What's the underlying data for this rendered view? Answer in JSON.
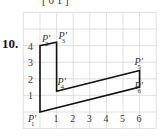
{
  "problem_number": "10.",
  "top_fragment": "[ 0        1 ]",
  "figure": {
    "x_ticks": [
      "1",
      "2",
      "3",
      "4",
      "5",
      "6"
    ],
    "y_ticks": [
      "1",
      "2",
      "3",
      "4"
    ],
    "points": [
      {
        "label": "P'",
        "sub": "1",
        "x": 0,
        "y": 0
      },
      {
        "label": "P'",
        "sub": "2",
        "x": 0,
        "y": 4
      },
      {
        "label": "P'",
        "sub": "3",
        "x": 1,
        "y": 4.2
      },
      {
        "label": "P'",
        "sub": "4",
        "x": 1,
        "y": 1.25
      },
      {
        "label": "P'",
        "sub": "5",
        "x": 6,
        "y": 2.5
      },
      {
        "label": "P'",
        "sub": "6",
        "x": 6,
        "y": 1.5
      }
    ]
  }
}
